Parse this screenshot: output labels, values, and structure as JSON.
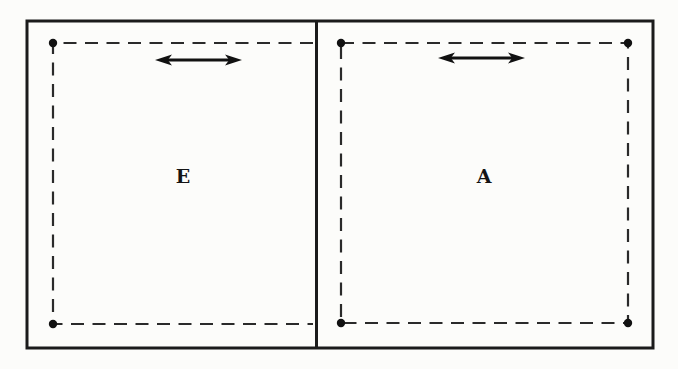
{
  "figure": {
    "background_color": "#fcfcfa",
    "line_color": "#1b1b1b",
    "left_panel": {
      "label": "E",
      "arrow_icon": "double-headed-horizontal-arrow",
      "dashed_outline": "open-right",
      "corner_dots": [
        "top-left",
        "bottom-left"
      ]
    },
    "right_panel": {
      "label": "A",
      "arrow_icon": "double-headed-horizontal-arrow",
      "dashed_outline": "closed-rectangle",
      "corner_dots": [
        "top-left",
        "top-right",
        "bottom-left",
        "bottom-right"
      ]
    }
  }
}
